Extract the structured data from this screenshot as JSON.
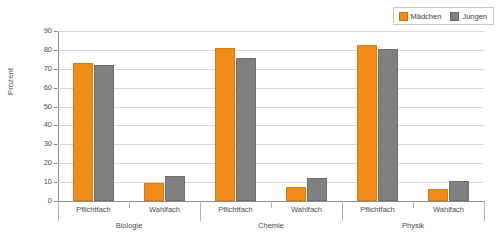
{
  "chart_data": {
    "type": "bar",
    "title": "",
    "subtitle": "",
    "xlabel": "",
    "ylabel": "Prozent",
    "ylim": [
      0,
      90
    ],
    "ytick_step": 10,
    "yticks": [
      0,
      10,
      20,
      30,
      40,
      50,
      60,
      70,
      80,
      90
    ],
    "grid": true,
    "grid_axis": "y",
    "legend_position": "top-right",
    "categories": [
      "Pflichtfach",
      "Wahlfach",
      "Pflichtfach",
      "Wahlfach",
      "Pflichtfach",
      "Wahlfach"
    ],
    "groups": [
      {
        "label": "Biologie",
        "categories": [
          "Pflichtfach",
          "Wahlfach"
        ]
      },
      {
        "label": "Chemie",
        "categories": [
          "Pflichtfach",
          "Wahlfach"
        ]
      },
      {
        "label": "Physik",
        "categories": [
          "Pflichtfach",
          "Wahlfach"
        ]
      }
    ],
    "series": [
      {
        "name": "Mädchen",
        "color": "#F28C18",
        "values": [
          73.0,
          9.5,
          81.0,
          7.5,
          82.5,
          6.5
        ]
      },
      {
        "name": "Jungen",
        "color": "#808080",
        "values": [
          72.0,
          13.0,
          75.5,
          12.0,
          80.5,
          10.5
        ]
      }
    ]
  },
  "legend": {
    "items": [
      {
        "label": "Mädchen",
        "color": "#F28C18"
      },
      {
        "label": "Jungen",
        "color": "#808080"
      }
    ]
  },
  "axes": {
    "y_title": "Prozent",
    "y_tick_labels": [
      "90",
      "80",
      "70",
      "60",
      "50",
      "40",
      "30",
      "20",
      "10",
      "0"
    ]
  }
}
